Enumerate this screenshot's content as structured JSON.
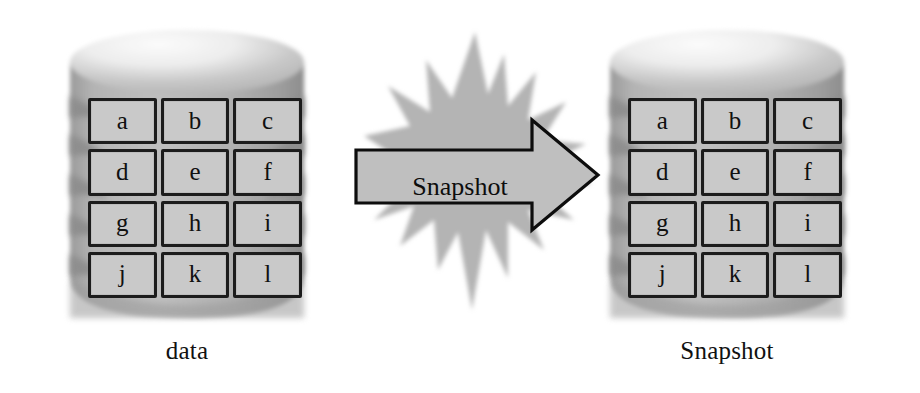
{
  "diagram": {
    "background_color": "#ffffff",
    "left_store": {
      "caption": "data",
      "cells": [
        [
          "a",
          "b",
          "c"
        ],
        [
          "d",
          "e",
          "f"
        ],
        [
          "g",
          "h",
          "i"
        ],
        [
          "j",
          "k",
          "l"
        ]
      ]
    },
    "right_store": {
      "caption": "Snapshot",
      "cells": [
        [
          "a",
          "b",
          "c"
        ],
        [
          "d",
          "e",
          "f"
        ],
        [
          "g",
          "h",
          "i"
        ],
        [
          "j",
          "k",
          "l"
        ]
      ]
    },
    "arrow": {
      "label": "Snapshot",
      "direction": "right",
      "fill_color": "#bfbfbf",
      "stroke_color": "#0d0d0d"
    },
    "burst": {
      "shape": "starburst",
      "fill_color": "#b5b5b5"
    },
    "colors": {
      "cell_fill": "#c9c9c9",
      "cell_border": "#1c1c1c",
      "cylinder_body": "#b2b2b2",
      "cylinder_highlight": "#f2f2f2",
      "cylinder_shade": "#8f8f8f",
      "text": "#101010"
    }
  }
}
